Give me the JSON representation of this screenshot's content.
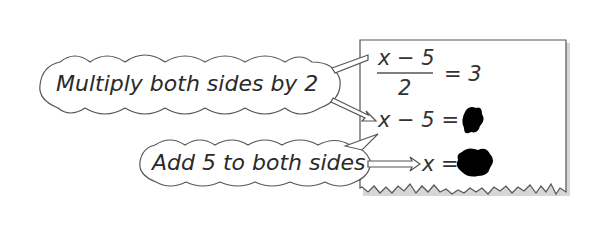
{
  "callouts": {
    "step1": "Multiply both sides by 2",
    "step2": "Add 5 to both sides"
  },
  "equations": {
    "line1_numerator": "x − 5",
    "line1_denominator": "2",
    "line1_rhs": "= 3",
    "line2_lhs": "x − 5 =",
    "line3_lhs": "x ="
  },
  "colors": {
    "stroke": "#555555",
    "text": "#2a2a2a",
    "blot": "#000000",
    "shadow": "#c8c8c8"
  }
}
